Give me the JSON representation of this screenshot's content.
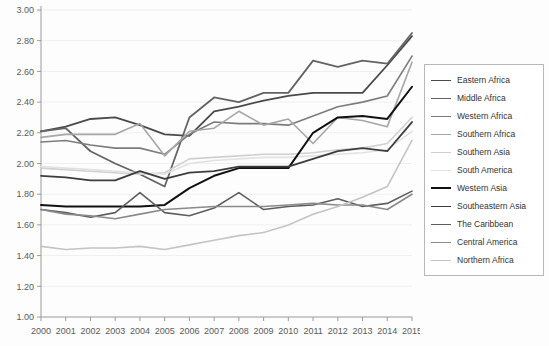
{
  "chart_data": {
    "type": "line",
    "title": "",
    "xlabel": "",
    "ylabel": "",
    "grid": true,
    "legend_position": "right",
    "ylim": [
      1.0,
      3.0
    ],
    "ytick_labels": [
      "1.00",
      "1.20",
      "1.40",
      "1.60",
      "1.80",
      "2.00",
      "2.20",
      "2.40",
      "2.60",
      "2.80",
      "3.00"
    ],
    "ytick_values": [
      1.0,
      1.2,
      1.4,
      1.6,
      1.8,
      2.0,
      2.2,
      2.4,
      2.6,
      2.8,
      3.0
    ],
    "categories": [
      "2000",
      "2001",
      "2002",
      "2003",
      "2004",
      "2005",
      "2006",
      "2007",
      "2008",
      "2009",
      "2010",
      "2011",
      "2012",
      "2013",
      "2014",
      "2015"
    ],
    "x": [
      2000,
      2001,
      2002,
      2003,
      2004,
      2005,
      2006,
      2007,
      2008,
      2009,
      2010,
      2011,
      2012,
      2013,
      2014,
      2015
    ],
    "series": [
      {
        "name": "Eastern Africa",
        "color": "#4a4a4a",
        "width": 1.8,
        "values": [
          2.21,
          2.24,
          2.29,
          2.3,
          2.25,
          2.19,
          2.18,
          2.34,
          2.37,
          2.41,
          2.44,
          2.46,
          2.46,
          2.46,
          2.64,
          2.83
        ]
      },
      {
        "name": "Middle Africa",
        "color": "#636363",
        "width": 1.8,
        "values": [
          2.21,
          2.23,
          2.08,
          2.0,
          1.93,
          1.85,
          2.3,
          2.43,
          2.4,
          2.46,
          2.46,
          2.67,
          2.63,
          2.67,
          2.65,
          2.85
        ]
      },
      {
        "name": "Western Africa",
        "color": "#7c7c7c",
        "width": 1.6,
        "values": [
          2.14,
          2.15,
          2.12,
          2.1,
          2.1,
          2.06,
          2.19,
          2.27,
          2.26,
          2.26,
          2.25,
          2.31,
          2.37,
          2.4,
          2.44,
          2.7
        ]
      },
      {
        "name": "Southern Africa",
        "color": "#a6a6a6",
        "width": 1.6,
        "values": [
          2.17,
          2.19,
          2.19,
          2.19,
          2.26,
          2.05,
          2.21,
          2.23,
          2.34,
          2.25,
          2.29,
          2.13,
          2.3,
          2.28,
          2.24,
          2.66
        ]
      },
      {
        "name": "Southern Asia",
        "color": "#d0d0d0",
        "width": 1.6,
        "values": [
          1.97,
          1.96,
          1.95,
          1.94,
          1.93,
          1.94,
          2.03,
          2.04,
          2.05,
          2.06,
          2.06,
          2.07,
          2.09,
          2.1,
          2.13,
          2.3
        ]
      },
      {
        "name": "South America",
        "color": "#e2e2e2",
        "width": 1.6,
        "values": [
          1.98,
          1.97,
          1.96,
          1.95,
          1.94,
          1.93,
          2.0,
          2.02,
          2.03,
          2.04,
          2.04,
          2.05,
          2.06,
          2.07,
          2.09,
          2.21
        ]
      },
      {
        "name": "Western Asia",
        "color": "#111111",
        "width": 2.0,
        "values": [
          1.73,
          1.72,
          1.72,
          1.72,
          1.72,
          1.73,
          1.84,
          1.92,
          1.97,
          1.97,
          1.97,
          2.2,
          2.3,
          2.31,
          2.29,
          2.5
        ]
      },
      {
        "name": "Southeastern Asia",
        "color": "#3d3d3d",
        "width": 1.8,
        "values": [
          1.92,
          1.91,
          1.89,
          1.89,
          1.95,
          1.9,
          1.94,
          1.95,
          1.98,
          1.98,
          1.98,
          2.03,
          2.08,
          2.1,
          2.08,
          2.27
        ]
      },
      {
        "name": "The Caribbean",
        "color": "#5e5e5e",
        "width": 1.6,
        "values": [
          1.7,
          1.68,
          1.65,
          1.68,
          1.81,
          1.68,
          1.66,
          1.71,
          1.81,
          1.7,
          1.72,
          1.73,
          1.77,
          1.72,
          1.74,
          1.82
        ]
      },
      {
        "name": "Central America",
        "color": "#8a8a8a",
        "width": 1.6,
        "values": [
          1.7,
          1.67,
          1.66,
          1.64,
          1.67,
          1.7,
          1.71,
          1.72,
          1.72,
          1.72,
          1.73,
          1.74,
          1.73,
          1.73,
          1.7,
          1.8
        ]
      },
      {
        "name": "Northern Africa",
        "color": "#c4c4c4",
        "width": 1.6,
        "values": [
          1.46,
          1.44,
          1.45,
          1.45,
          1.46,
          1.44,
          1.47,
          1.5,
          1.53,
          1.55,
          1.6,
          1.67,
          1.72,
          1.78,
          1.85,
          2.15
        ]
      }
    ]
  },
  "legend": {
    "items": [
      {
        "label": "Eastern Africa"
      },
      {
        "label": "Middle Africa"
      },
      {
        "label": "Western Africa"
      },
      {
        "label": "Southern Africa"
      },
      {
        "label": "Southern Asia"
      },
      {
        "label": "South America"
      },
      {
        "label": "Western Asia"
      },
      {
        "label": "Southeastern Asia"
      },
      {
        "label": "The Caribbean"
      },
      {
        "label": "Central America"
      },
      {
        "label": "Northern Africa"
      }
    ]
  }
}
